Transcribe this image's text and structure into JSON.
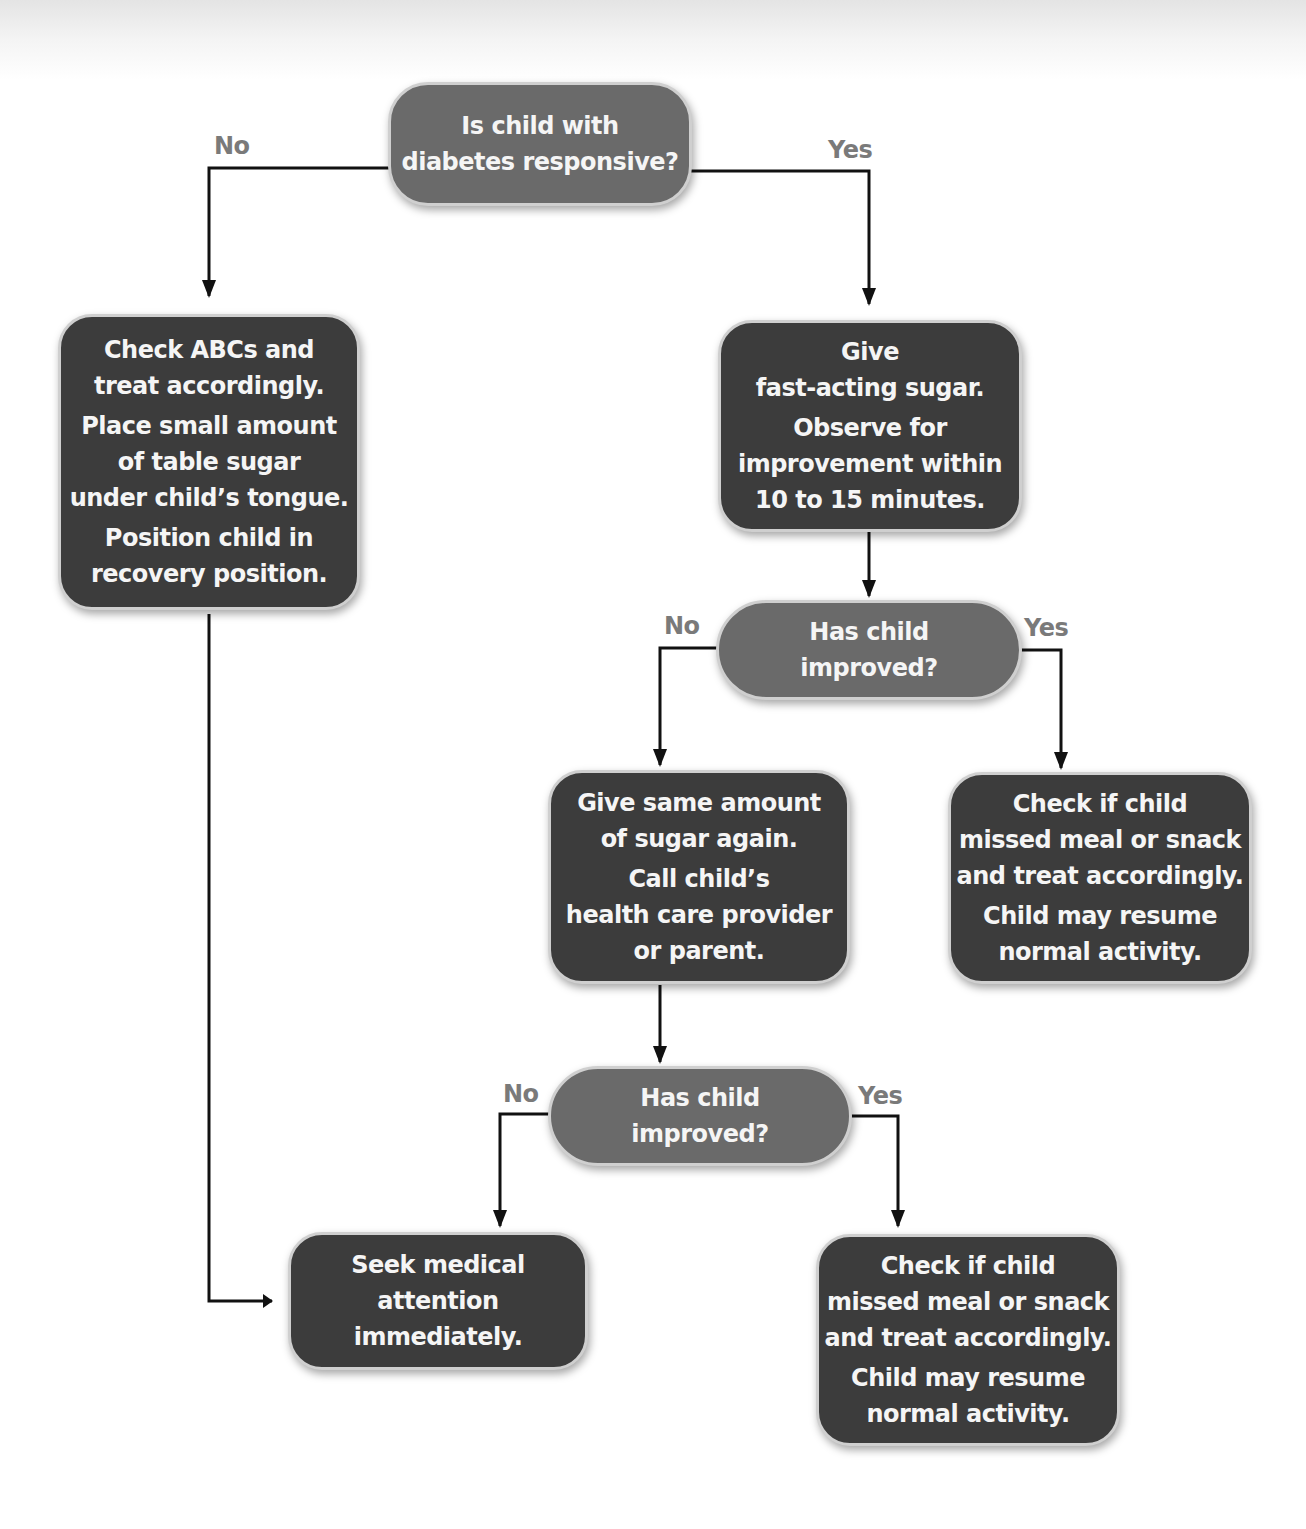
{
  "flowchart": {
    "nodes": {
      "q1": {
        "lines": [
          "Is child with",
          "diabetes responsive?"
        ]
      },
      "a_no1": {
        "p1": [
          "Check ABCs and",
          "treat accordingly."
        ],
        "p2": [
          "Place small amount",
          "of table sugar",
          "under child’s tongue."
        ],
        "p3": [
          "Position child in",
          "recovery position."
        ]
      },
      "a_yes1": {
        "p1": [
          "Give",
          "fast-acting sugar."
        ],
        "p2": [
          "Observe for",
          "improvement within",
          "10 to 15 minutes."
        ]
      },
      "q2": {
        "lines": [
          "Has child",
          "improved?"
        ]
      },
      "a_no2": {
        "p1": [
          "Give same amount",
          "of sugar again."
        ],
        "p2": [
          "Call child’s",
          "health care provider",
          "or parent."
        ]
      },
      "a_yes2": {
        "p1": [
          "Check if child",
          "missed meal or snack",
          "and treat accordingly."
        ],
        "p2": [
          "Child may resume",
          "normal activity."
        ]
      },
      "q3": {
        "lines": [
          "Has child",
          "improved?"
        ]
      },
      "a_no3": {
        "lines": [
          "Seek medical",
          "attention",
          "immediately."
        ]
      },
      "a_yes3": {
        "p1": [
          "Check if child",
          "missed meal or snack",
          "and treat accordingly."
        ],
        "p2": [
          "Child may resume",
          "normal activity."
        ]
      }
    },
    "edge_labels": {
      "q1_no": "No",
      "q1_yes": "Yes",
      "q2_no": "No",
      "q2_yes": "Yes",
      "q3_no": "No",
      "q3_yes": "Yes"
    },
    "colors": {
      "decision_fill": "#6a6a6a",
      "action_fill": "#3c3c3c",
      "node_border": "#cfcfcf",
      "node_text": "#f5f5f5",
      "edge_label": "#7a7a7a",
      "connector": "#111111"
    }
  }
}
